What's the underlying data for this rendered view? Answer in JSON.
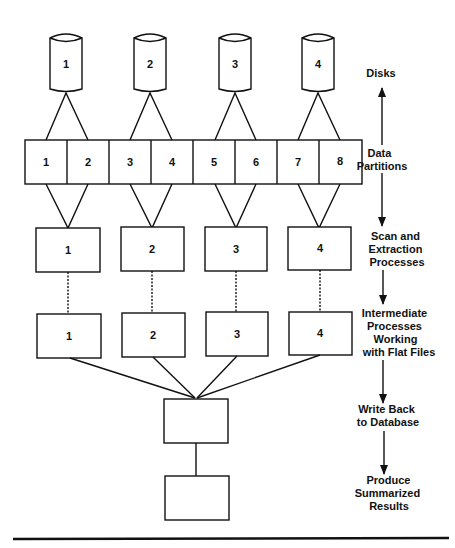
{
  "diagram": {
    "disks": [
      {
        "label": "1"
      },
      {
        "label": "2"
      },
      {
        "label": "3"
      },
      {
        "label": "4"
      }
    ],
    "partitions": [
      {
        "label": "1"
      },
      {
        "label": "2"
      },
      {
        "label": "3"
      },
      {
        "label": "4"
      },
      {
        "label": "5"
      },
      {
        "label": "6"
      },
      {
        "label": "7"
      },
      {
        "label": "8"
      }
    ],
    "scan_processes": [
      {
        "label": "1"
      },
      {
        "label": "2"
      },
      {
        "label": "3"
      },
      {
        "label": "4"
      }
    ],
    "intermediate_processes": [
      {
        "label": "1"
      },
      {
        "label": "2"
      },
      {
        "label": "3"
      },
      {
        "label": "4"
      }
    ],
    "write_back_box": {
      "label": ""
    },
    "summary_box": {
      "label": ""
    },
    "stage_labels": [
      {
        "lines": [
          "Disks"
        ]
      },
      {
        "lines": [
          "Data",
          "Partitions"
        ]
      },
      {
        "lines": [
          "Scan and",
          "Extraction",
          "Processes"
        ]
      },
      {
        "lines": [
          "Intermediate",
          "Processes",
          "Working",
          "with Flat Files"
        ]
      },
      {
        "lines": [
          "Write Back",
          "to Database"
        ]
      },
      {
        "lines": [
          "Produce",
          "Summarized",
          "Results"
        ]
      }
    ]
  }
}
